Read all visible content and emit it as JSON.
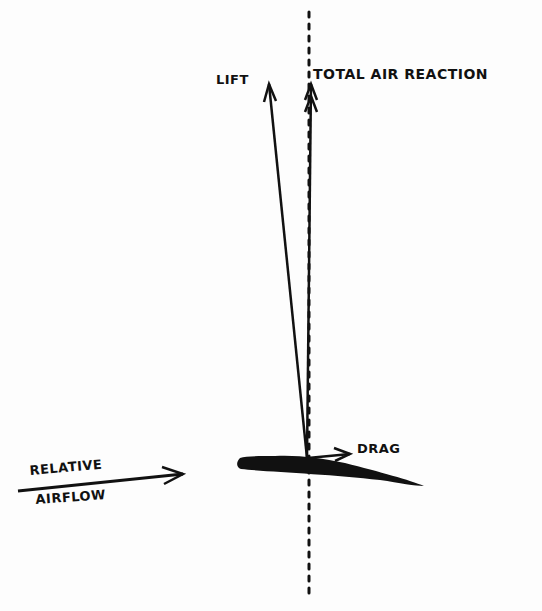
{
  "diagram": {
    "type": "aerofoil force diagram",
    "labels": {
      "lift": "LIFT",
      "total_air_reaction": "TOTAL AIR REACTION",
      "drag": "DRAG",
      "relative": "RELATIVE",
      "airflow": "AIRFLOW"
    },
    "colors": {
      "ink": "#111111",
      "background": "#fdfdfd"
    }
  }
}
